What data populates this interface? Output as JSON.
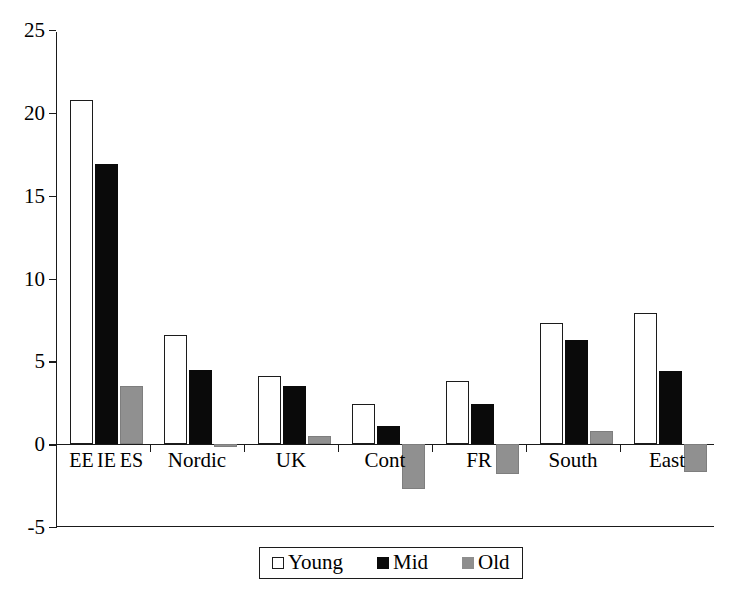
{
  "chart_data": {
    "type": "bar",
    "title": "",
    "subtitle": "",
    "xlabel": "",
    "ylabel": "",
    "ylim": [
      -5,
      25
    ],
    "yticks": [
      25,
      20,
      15,
      10,
      5,
      0,
      -5
    ],
    "grid": false,
    "legend_position": "bottom-center",
    "categories": [
      "EE IE ES",
      "Nordic",
      "UK",
      "Cont",
      "FR",
      "South",
      "East"
    ],
    "category_sublabels": [
      [
        "EE",
        "IE",
        "ES"
      ],
      [],
      [],
      [],
      [],
      [],
      []
    ],
    "series": [
      {
        "name": "Young",
        "color": "#ffffff",
        "values": [
          20.8,
          6.6,
          4.1,
          2.4,
          3.8,
          7.3,
          7.9
        ]
      },
      {
        "name": "Mid",
        "color": "#0a0a0a",
        "values": [
          16.9,
          4.5,
          3.5,
          1.1,
          2.4,
          6.3,
          4.4
        ]
      },
      {
        "name": "Old",
        "color": "#909090",
        "values": [
          3.5,
          -0.2,
          0.5,
          -2.7,
          -1.8,
          0.8,
          -1.7
        ]
      }
    ]
  },
  "axis": {
    "y_tick_labels": [
      "25",
      "20",
      "15",
      "10",
      "5",
      "0",
      "-5"
    ]
  },
  "legend": {
    "items": [
      {
        "label": "Young"
      },
      {
        "label": "Mid"
      },
      {
        "label": "Old"
      }
    ]
  }
}
